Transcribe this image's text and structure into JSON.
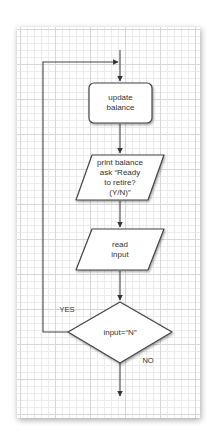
{
  "diagram": {
    "type": "flowchart",
    "colors": {
      "stroke": "#444444",
      "shape_fill": "#ffffff",
      "grid_major": "#d6d6d6",
      "grid_minor": "#ececec",
      "text": "#333333"
    },
    "nodes": [
      {
        "id": "update",
        "shape": "rounded-rectangle",
        "line1": "update",
        "line2": "balance"
      },
      {
        "id": "print",
        "shape": "parallelogram",
        "line1": "print balance",
        "line2": "ask “Ready",
        "line3": "to retire?",
        "line4": "(Y/N)”"
      },
      {
        "id": "read",
        "shape": "parallelogram",
        "line1": "read",
        "line2": "input"
      },
      {
        "id": "decision",
        "shape": "diamond",
        "text": "input=“N”"
      }
    ],
    "edges": {
      "yes_label": "YES",
      "no_label": "NO"
    }
  }
}
